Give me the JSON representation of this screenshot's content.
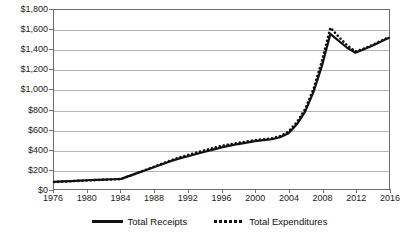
{
  "chart_data": {
    "type": "line",
    "title": "",
    "xlabel": "",
    "ylabel": "",
    "xlim": [
      1976,
      2016
    ],
    "ylim": [
      0,
      1800
    ],
    "grid": true,
    "legend_position": "bottom",
    "x_tick_labels": [
      "1976",
      "1980",
      "1984",
      "1988",
      "1992",
      "1996",
      "2000",
      "2004",
      "2008",
      "2012",
      "2016"
    ],
    "x_tick_values": [
      1976,
      1980,
      1984,
      1988,
      1992,
      1996,
      2000,
      2004,
      2008,
      2012,
      2016
    ],
    "y_tick_labels": [
      "$0",
      "$200",
      "$400",
      "$600",
      "$800",
      "$1,000",
      "$1,200",
      "$1,400",
      "$1,600",
      "$1,800"
    ],
    "y_tick_values": [
      0,
      200,
      400,
      600,
      800,
      1000,
      1200,
      1400,
      1600,
      1800
    ],
    "x": [
      1976,
      1977,
      1978,
      1979,
      1980,
      1981,
      1982,
      1983,
      1984,
      1985,
      1986,
      1987,
      1988,
      1989,
      1990,
      1991,
      1992,
      1993,
      1994,
      1995,
      1996,
      1997,
      1998,
      1999,
      2000,
      2001,
      2002,
      2003,
      2004,
      2005,
      2006,
      2007,
      2008,
      2009,
      2010,
      2011,
      2012,
      2013,
      2014,
      2015,
      2016
    ],
    "series": [
      {
        "name": "Total Receipts",
        "style": "solid",
        "color": "#111111",
        "values": [
          72,
          76,
          80,
          84,
          88,
          92,
          95,
          98,
          102,
          132,
          162,
          192,
          222,
          252,
          282,
          308,
          330,
          352,
          374,
          396,
          418,
          436,
          452,
          466,
          482,
          492,
          500,
          520,
          560,
          650,
          780,
          980,
          1240,
          1560,
          1490,
          1420,
          1370,
          1405,
          1440,
          1480,
          1520
        ]
      },
      {
        "name": "Total Expenditures",
        "style": "dotted",
        "color": "#111111",
        "values": [
          70,
          74,
          78,
          82,
          86,
          90,
          93,
          96,
          100,
          130,
          162,
          194,
          226,
          258,
          290,
          318,
          342,
          366,
          390,
          412,
          434,
          450,
          464,
          478,
          492,
          500,
          510,
          532,
          578,
          672,
          806,
          1010,
          1290,
          1622,
          1530,
          1445,
          1382,
          1412,
          1448,
          1488,
          1528
        ]
      }
    ],
    "legend": [
      {
        "label": "Total Receipts",
        "style": "solid"
      },
      {
        "label": "Total Expenditures",
        "style": "dotted"
      }
    ]
  }
}
